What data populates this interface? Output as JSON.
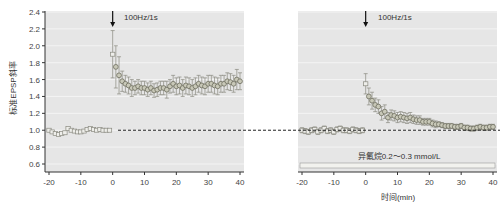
{
  "chart_data": [
    {
      "type": "scatter",
      "title": "",
      "annotation": "100Hz/1s",
      "ylabel": "标准EPSP斜率",
      "xlabel": "",
      "xlim": [
        -20,
        40
      ],
      "ylim": [
        0.6,
        2.4
      ],
      "xticks": [
        -20,
        -10,
        0,
        10,
        20,
        30,
        40
      ],
      "yticks": [
        0.6,
        0.8,
        1.0,
        1.2,
        1.4,
        1.6,
        1.8,
        2.0,
        2.2,
        2.4
      ],
      "grid": true,
      "baseline": 1.0,
      "series": [
        {
          "name": "control",
          "x": [
            -20,
            -19,
            -18,
            -17,
            -16,
            -15,
            -14,
            -13,
            -12,
            -11,
            -10,
            -9,
            -8,
            -7,
            -6,
            -5,
            -4,
            -3,
            -2,
            -1,
            0,
            1,
            2,
            3,
            4,
            5,
            6,
            7,
            8,
            9,
            10,
            11,
            12,
            13,
            14,
            15,
            16,
            17,
            18,
            19,
            20,
            21,
            22,
            23,
            24,
            25,
            26,
            27,
            28,
            29,
            30,
            31,
            32,
            33,
            34,
            35,
            36,
            37,
            38,
            39,
            40
          ],
          "y": [
            1.0,
            0.98,
            0.96,
            0.95,
            0.96,
            0.97,
            1.02,
            1.0,
            0.99,
            0.98,
            0.98,
            0.99,
            1.01,
            1.02,
            1.01,
            1.0,
            1.01,
            1.0,
            1.0,
            1.0,
            1.9,
            1.75,
            1.65,
            1.58,
            1.55,
            1.53,
            1.5,
            1.5,
            1.52,
            1.5,
            1.5,
            1.48,
            1.5,
            1.47,
            1.48,
            1.5,
            1.5,
            1.48,
            1.52,
            1.55,
            1.52,
            1.53,
            1.5,
            1.53,
            1.52,
            1.5,
            1.52,
            1.55,
            1.53,
            1.52,
            1.55,
            1.55,
            1.53,
            1.52,
            1.55,
            1.55,
            1.58,
            1.57,
            1.55,
            1.6,
            1.58
          ],
          "err": [
            0.02,
            0.02,
            0.02,
            0.02,
            0.02,
            0.02,
            0.02,
            0.02,
            0.02,
            0.02,
            0.02,
            0.02,
            0.02,
            0.02,
            0.02,
            0.02,
            0.02,
            0.02,
            0.02,
            0.02,
            0.28,
            0.25,
            0.22,
            0.12,
            0.1,
            0.1,
            0.1,
            0.08,
            0.08,
            0.08,
            0.08,
            0.08,
            0.08,
            0.08,
            0.08,
            0.08,
            0.08,
            0.1,
            0.08,
            0.1,
            0.1,
            0.1,
            0.1,
            0.1,
            0.1,
            0.1,
            0.1,
            0.1,
            0.1,
            0.1,
            0.1,
            0.1,
            0.1,
            0.1,
            0.1,
            0.1,
            0.1,
            0.1,
            0.1,
            0.12,
            0.1
          ]
        }
      ]
    },
    {
      "type": "scatter",
      "annotation": "100Hz/1s",
      "xlabel": "时间(min)",
      "bar_label": "异氟烷0.2～0.3 mmol/L",
      "xlim": [
        -20,
        40
      ],
      "ylim": [
        0.6,
        2.4
      ],
      "xticks": [
        -20,
        -10,
        0,
        10,
        20,
        30,
        40
      ],
      "grid": true,
      "baseline": 1.0,
      "series": [
        {
          "name": "isoflurane",
          "x": [
            -20,
            -19,
            -18,
            -17,
            -16,
            -15,
            -14,
            -13,
            -12,
            -11,
            -10,
            -9,
            -8,
            -7,
            -6,
            -5,
            -4,
            -3,
            -2,
            -1,
            0,
            1,
            2,
            3,
            4,
            5,
            6,
            7,
            8,
            9,
            10,
            11,
            12,
            13,
            14,
            15,
            16,
            17,
            18,
            19,
            20,
            21,
            22,
            23,
            24,
            25,
            26,
            27,
            28,
            29,
            30,
            31,
            32,
            33,
            34,
            35,
            36,
            37,
            38,
            39,
            40
          ],
          "y": [
            1.0,
            0.99,
            0.98,
            1.0,
            1.01,
            0.98,
            1.0,
            1.02,
            0.99,
            1.0,
            0.98,
            1.01,
            1.02,
            1.0,
            1.0,
            0.99,
            1.01,
            1.0,
            0.99,
            1.0,
            1.55,
            1.4,
            1.35,
            1.3,
            1.28,
            1.2,
            1.22,
            1.15,
            1.18,
            1.17,
            1.15,
            1.16,
            1.15,
            1.14,
            1.15,
            1.13,
            1.12,
            1.12,
            1.1,
            1.1,
            1.1,
            1.08,
            1.07,
            1.07,
            1.06,
            1.05,
            1.05,
            1.05,
            1.04,
            1.04,
            1.05,
            1.03,
            1.03,
            1.02,
            1.02,
            1.03,
            1.04,
            1.03,
            1.03,
            1.04,
            1.04
          ],
          "err": [
            0.03,
            0.03,
            0.03,
            0.03,
            0.03,
            0.03,
            0.03,
            0.03,
            0.03,
            0.03,
            0.03,
            0.03,
            0.03,
            0.03,
            0.03,
            0.03,
            0.03,
            0.03,
            0.03,
            0.03,
            0.12,
            0.1,
            0.1,
            0.08,
            0.08,
            0.08,
            0.08,
            0.06,
            0.06,
            0.06,
            0.06,
            0.06,
            0.06,
            0.06,
            0.06,
            0.05,
            0.05,
            0.05,
            0.04,
            0.04,
            0.04,
            0.04,
            0.04,
            0.03,
            0.03,
            0.03,
            0.03,
            0.03,
            0.03,
            0.03,
            0.03,
            0.03,
            0.03,
            0.03,
            0.03,
            0.03,
            0.03,
            0.03,
            0.03,
            0.03,
            0.03
          ]
        }
      ]
    }
  ],
  "colors": {
    "plot_bg": "#e6e6e6",
    "grid": "#f4f4f4",
    "marker": "#8a8a80",
    "marker_fill": "#c8c8b8",
    "axis": "#333333"
  }
}
